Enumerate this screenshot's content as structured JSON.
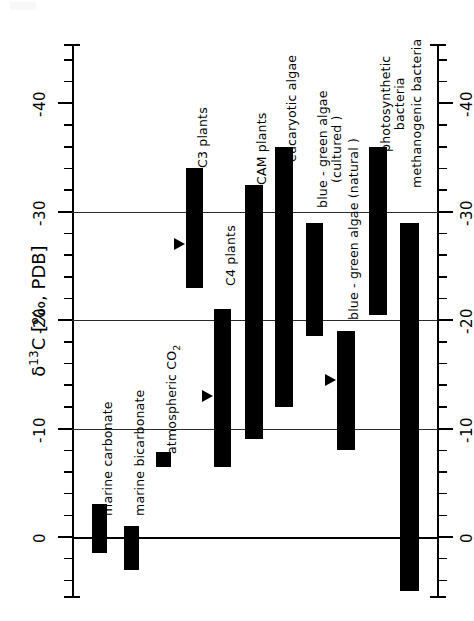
{
  "figure": {
    "orientation": "rotated-90",
    "background_color": "#ffffff",
    "ink_color": "#000000"
  },
  "axis": {
    "title_delta": "δ",
    "title_sup": "13",
    "title_rest": "C [‰, PDB]",
    "title_full": "δ13C [‰, PDB]",
    "tick_labels": [
      "0",
      "-10",
      "-20",
      "-30",
      "-40"
    ]
  },
  "chart_data": {
    "type": "bar",
    "title": "",
    "subtitle": "",
    "xlabel": "",
    "ylabel": "δ13C [‰, PDB]",
    "ylim": [
      5,
      -45
    ],
    "yticks": [
      0,
      -10,
      -20,
      -30,
      -40
    ],
    "ytick_labels": [
      "0",
      "-10",
      "-20",
      "-30",
      "-40"
    ],
    "minor_tick_interval": 2,
    "grid": true,
    "gridlines_at": [
      0,
      -10,
      -20,
      -30
    ],
    "legend": "none",
    "orientation": "horizontal-ranges",
    "note": "Each category is drawn as a filled range bar spanning its min to max delta-13C value; triangular markers indicate representative/mean values.",
    "categories": [
      {
        "label": "marine carbonate",
        "label_lines": [
          "marine  carbonate"
        ],
        "range_min": -3.0,
        "range_max": 1.5,
        "marker": null
      },
      {
        "label": "marine bicarbonate",
        "label_lines": [
          "marine  bicarbonate"
        ],
        "range_min": -1.0,
        "range_max": 3.0,
        "marker": null
      },
      {
        "label": "atmospheric CO2",
        "label_lines": [
          "atmospheric  CO2"
        ],
        "range_min": -7.8,
        "range_max": -6.5,
        "marker": null
      },
      {
        "label": "C3 plants",
        "label_lines": [
          "C3 plants"
        ],
        "range_min": -23.0,
        "range_max": -34.0,
        "marker": -27.0
      },
      {
        "label": "C4 plants",
        "label_lines": [
          "C4 plants"
        ],
        "range_min": -6.5,
        "range_max": -21.0,
        "marker": -13.0
      },
      {
        "label": "CAM plants",
        "label_lines": [
          "CAM plants"
        ],
        "range_min": -9.0,
        "range_max": -32.5,
        "marker": null
      },
      {
        "label": "eucaryotic algae",
        "label_lines": [
          "eucaryotic algae"
        ],
        "range_min": -12.0,
        "range_max": -36.0,
        "marker": null
      },
      {
        "label": "blue-green algae (cultured)",
        "label_lines": [
          "blue - green algae",
          "(cultured )"
        ],
        "range_min": -18.5,
        "range_max": -29.0,
        "marker": null
      },
      {
        "label": "blue-green algae (natural)",
        "label_lines": [
          "blue - green algae (natural )"
        ],
        "range_min": -8.0,
        "range_max": -19.0,
        "marker": -14.5
      },
      {
        "label": "photosynthetic bacteria",
        "label_lines": [
          "photosynthetic",
          "bacteria"
        ],
        "range_min": -20.5,
        "range_max": -36.0,
        "marker": null
      },
      {
        "label": "methanogenic bacteria",
        "label_lines": [
          "methanogenic bacteria"
        ],
        "range_min": 5.0,
        "range_max": -29.0,
        "marker": null
      }
    ]
  }
}
